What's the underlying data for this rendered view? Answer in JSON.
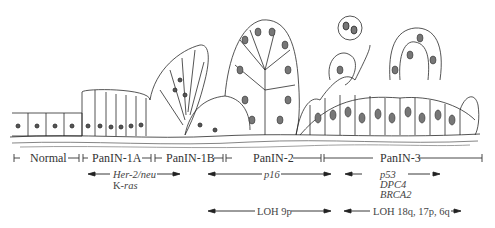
{
  "stages": [
    {
      "label": "Normal"
    },
    {
      "label": "PanIN-1A"
    },
    {
      "label": "PanIN-1B"
    },
    {
      "label": "PanIN-2"
    },
    {
      "label": "PanIN-3"
    }
  ],
  "genetic_alterations": {
    "early": {
      "line1": "Her-2/neu",
      "line2_prefix": "K-",
      "line2_italic": "ras"
    },
    "middle": {
      "label": "p16"
    },
    "late": {
      "line1": "p53",
      "line2": "DPC4",
      "line3": "BRCA2"
    }
  },
  "loh": {
    "middle": {
      "label": "LOH 9p"
    },
    "late": {
      "label": "LOH 18q, 17p, 6q"
    }
  }
}
